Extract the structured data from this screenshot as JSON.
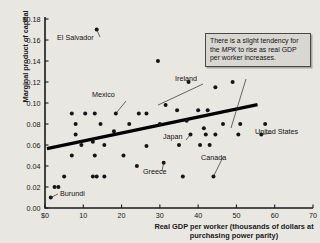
{
  "chart_data": {
    "type": "scatter",
    "title": "",
    "xlabel": "Real GDP per worker (thousands of dollars at purchasing power parity)",
    "ylabel": "Marginal product of capital",
    "xlim": [
      0,
      70
    ],
    "ylim": [
      0.0,
      0.18
    ],
    "grid": false,
    "legend": "none",
    "xticks": [
      "$0",
      "10",
      "20",
      "30",
      "40",
      "50",
      "60",
      "70"
    ],
    "xtick_values": [
      0,
      10,
      20,
      30,
      40,
      50,
      60,
      70
    ],
    "yticks": [
      "0.00",
      "0.02",
      "0.04",
      "0.06",
      "0.08",
      "0.10",
      "0.12",
      "0.14",
      "0.16",
      "$0.18"
    ],
    "ytick_values": [
      0.0,
      0.02,
      0.04,
      0.06,
      0.08,
      0.1,
      0.12,
      0.14,
      0.16,
      0.18
    ],
    "points": [
      {
        "x": 13.5,
        "y": 0.17
      },
      {
        "x": 29.5,
        "y": 0.14
      },
      {
        "x": 37.5,
        "y": 0.12
      },
      {
        "x": 49.0,
        "y": 0.12
      },
      {
        "x": 44.5,
        "y": 0.115
      },
      {
        "x": 7.0,
        "y": 0.09
      },
      {
        "x": 10.5,
        "y": 0.09
      },
      {
        "x": 13.0,
        "y": 0.09
      },
      {
        "x": 18.5,
        "y": 0.09
      },
      {
        "x": 24.5,
        "y": 0.09
      },
      {
        "x": 26.5,
        "y": 0.09
      },
      {
        "x": 34.5,
        "y": 0.093
      },
      {
        "x": 40.0,
        "y": 0.093
      },
      {
        "x": 42.5,
        "y": 0.093
      },
      {
        "x": 31.5,
        "y": 0.098
      },
      {
        "x": 8.0,
        "y": 0.08
      },
      {
        "x": 14.5,
        "y": 0.08
      },
      {
        "x": 22.0,
        "y": 0.08
      },
      {
        "x": 30.0,
        "y": 0.08
      },
      {
        "x": 37.0,
        "y": 0.083
      },
      {
        "x": 46.5,
        "y": 0.08
      },
      {
        "x": 51.0,
        "y": 0.08
      },
      {
        "x": 57.5,
        "y": 0.08
      },
      {
        "x": 8.0,
        "y": 0.07
      },
      {
        "x": 18.0,
        "y": 0.073
      },
      {
        "x": 41.5,
        "y": 0.076
      },
      {
        "x": 12.5,
        "y": 0.063
      },
      {
        "x": 15.5,
        "y": 0.06
      },
      {
        "x": 9.5,
        "y": 0.06
      },
      {
        "x": 26.5,
        "y": 0.059
      },
      {
        "x": 38.0,
        "y": 0.07
      },
      {
        "x": 42.0,
        "y": 0.07
      },
      {
        "x": 44.5,
        "y": 0.07
      },
      {
        "x": 50.5,
        "y": 0.07
      },
      {
        "x": 56.5,
        "y": 0.07
      },
      {
        "x": 7.0,
        "y": 0.05
      },
      {
        "x": 13.0,
        "y": 0.05
      },
      {
        "x": 20.5,
        "y": 0.05
      },
      {
        "x": 35.0,
        "y": 0.06
      },
      {
        "x": 40.5,
        "y": 0.06
      },
      {
        "x": 43.0,
        "y": 0.06
      },
      {
        "x": 24.0,
        "y": 0.04
      },
      {
        "x": 5.0,
        "y": 0.03
      },
      {
        "x": 12.5,
        "y": 0.03
      },
      {
        "x": 13.5,
        "y": 0.03
      },
      {
        "x": 15.5,
        "y": 0.03
      },
      {
        "x": 31.0,
        "y": 0.043
      },
      {
        "x": 2.5,
        "y": 0.02
      },
      {
        "x": 3.5,
        "y": 0.02
      },
      {
        "x": 1.5,
        "y": 0.01
      },
      {
        "x": 36.0,
        "y": 0.03
      },
      {
        "x": 44.0,
        "y": 0.03
      }
    ],
    "trendline": {
      "x0": 0.5,
      "y0": 0.0565,
      "x1": 55.5,
      "y1": 0.0985
    },
    "annotations": [
      {
        "label": "El Salvador",
        "target_x": 13.5,
        "target_y": 0.17
      },
      {
        "label": "Mexico",
        "target_x": 18.5,
        "target_y": 0.09
      },
      {
        "label": "Ireland",
        "target_x": 29.5,
        "target_y": 0.098
      },
      {
        "label": "Japan",
        "target_x": 38.0,
        "target_y": 0.07
      },
      {
        "label": "Greece",
        "target_x": 31.0,
        "target_y": 0.043
      },
      {
        "label": "Canada",
        "target_x": 44.0,
        "target_y": 0.03
      },
      {
        "label": "United States",
        "target_x": 56.5,
        "target_y": 0.07
      },
      {
        "label": "Burundi",
        "target_x": 1.5,
        "target_y": 0.01
      }
    ],
    "callout_text_parts": {
      "before": "There is a slight tendency for the ",
      "emphasis": "MPK",
      "after": " to rise as real GDP per worker increases."
    },
    "callout_text": "There is a slight tendency for the MPK to rise as real GDP per worker increases."
  },
  "colors": {
    "background": "#e9e7e2",
    "point": "#151515",
    "axis": "#1a1a1a",
    "callout_bg": "#d9d7d2",
    "callout_border": "#4a4a4a"
  }
}
